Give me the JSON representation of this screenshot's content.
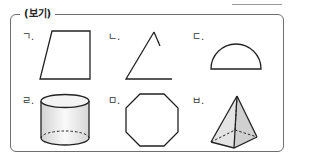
{
  "header": {
    "badge_open": "(",
    "badge_text": "보기",
    "badge_close": ")"
  },
  "items": [
    {
      "label": "ㄱ.",
      "shape": "trapezoid"
    },
    {
      "label": "ㄴ.",
      "shape": "open-angle"
    },
    {
      "label": "ㄷ.",
      "shape": "semicircle"
    },
    {
      "label": "ㄹ.",
      "shape": "cylinder"
    },
    {
      "label": "ㅁ.",
      "shape": "octagon"
    },
    {
      "label": "ㅂ.",
      "shape": "square-pyramid"
    }
  ],
  "colors": {
    "stroke": "#222222",
    "border": "#6e6e6e",
    "fill_light": "#ececec"
  }
}
